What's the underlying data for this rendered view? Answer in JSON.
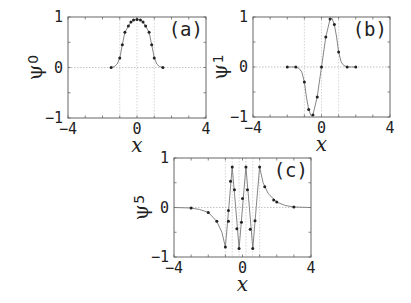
{
  "chart_data": [
    {
      "type": "line",
      "panel_tag": "(a)",
      "ylabel": "ψ",
      "ylabel_sub": "0",
      "xlabel": "x",
      "xlim": [
        -4,
        4
      ],
      "ylim": [
        -1,
        1
      ],
      "xticks": [
        -4,
        0,
        4
      ],
      "yticks": [
        -1,
        0,
        1
      ],
      "xtick_labels": [
        "−4",
        "0",
        "4"
      ],
      "ytick_labels": [
        "−1",
        "0",
        "1"
      ],
      "grid_x": [
        -1,
        0,
        1
      ],
      "markers": {
        "x": [
          -1.5,
          -1.0,
          -0.85,
          -0.7,
          -0.5,
          -0.35,
          -0.2,
          0.0,
          0.2,
          0.35,
          0.5,
          0.7,
          0.85,
          1.0,
          1.5
        ],
        "y": [
          0.0,
          0.19,
          0.45,
          0.7,
          0.82,
          0.9,
          0.94,
          0.95,
          0.94,
          0.9,
          0.82,
          0.7,
          0.45,
          0.19,
          0.0
        ]
      },
      "curve": {
        "x": [
          -1.5,
          -1.3,
          -1.15,
          -1.0,
          -0.85,
          -0.7,
          -0.5,
          -0.35,
          -0.2,
          0.0,
          0.2,
          0.35,
          0.5,
          0.7,
          0.85,
          1.0,
          1.15,
          1.3,
          1.5
        ],
        "y": [
          0.0,
          0.02,
          0.07,
          0.19,
          0.45,
          0.7,
          0.82,
          0.9,
          0.94,
          0.95,
          0.94,
          0.9,
          0.82,
          0.7,
          0.45,
          0.19,
          0.07,
          0.02,
          0.0
        ]
      }
    },
    {
      "type": "line",
      "panel_tag": "(b)",
      "ylabel": "ψ",
      "ylabel_sub": "1",
      "xlabel": "x",
      "xlim": [
        -4,
        4
      ],
      "ylim": [
        -1,
        1
      ],
      "xticks": [
        -4,
        0,
        4
      ],
      "yticks": [
        -1,
        0,
        1
      ],
      "xtick_labels": [
        "−4",
        "0",
        "4"
      ],
      "ytick_labels": [
        "−1",
        "0",
        "1"
      ],
      "grid_x": [
        -1,
        0,
        1
      ],
      "markers": {
        "x": [
          -2.0,
          -1.5,
          -1.0,
          -0.75,
          -0.5,
          -0.25,
          0.0,
          0.25,
          0.5,
          0.75,
          1.0,
          1.5,
          2.0
        ],
        "y": [
          0.0,
          0.0,
          -0.3,
          -0.85,
          -0.96,
          -0.6,
          0.0,
          0.6,
          0.96,
          0.85,
          0.3,
          0.0,
          0.0
        ]
      },
      "curve": {
        "x": [
          -2.0,
          -1.5,
          -1.3,
          -1.15,
          -1.0,
          -0.88,
          -0.75,
          -0.62,
          -0.5,
          -0.25,
          0.0,
          0.25,
          0.5,
          0.62,
          0.75,
          0.88,
          1.0,
          1.15,
          1.3,
          1.5,
          2.0
        ],
        "y": [
          0.0,
          0.0,
          -0.03,
          -0.1,
          -0.3,
          -0.6,
          -0.85,
          -0.97,
          -0.96,
          -0.6,
          0.0,
          0.6,
          0.96,
          0.97,
          0.85,
          0.6,
          0.3,
          0.1,
          0.03,
          0.0,
          0.0
        ]
      }
    },
    {
      "type": "line",
      "panel_tag": "(c)",
      "ylabel": "ψ",
      "ylabel_sub": "5",
      "xlabel": "x",
      "xlim": [
        -4,
        4
      ],
      "ylim": [
        -1,
        1
      ],
      "xticks": [
        -4,
        0,
        4
      ],
      "yticks": [
        -1,
        0,
        1
      ],
      "xtick_labels": [
        "−4",
        "0",
        "4"
      ],
      "ytick_labels": [
        "−1",
        "0",
        "1"
      ],
      "grid_x": [
        -1,
        -0.6,
        -0.2,
        0.2,
        0.6,
        1
      ],
      "markers": {
        "x": [
          -3.0,
          -2.0,
          -1.5,
          -1.0,
          -0.82,
          -0.82,
          -0.7,
          -0.6,
          -0.47,
          -0.33,
          -0.2,
          -0.06,
          0.0,
          0.2,
          0.29,
          0.45,
          0.6,
          0.73,
          1.0,
          1.3,
          1.82,
          2.0,
          3.0
        ],
        "y": [
          -0.01,
          -0.1,
          -0.28,
          -0.8,
          -0.28,
          -0.06,
          0.53,
          0.82,
          0.36,
          -0.43,
          -0.83,
          -0.3,
          0.18,
          0.82,
          0.36,
          -0.44,
          -0.83,
          -0.27,
          0.82,
          0.42,
          0.15,
          0.11,
          0.01
        ]
      },
      "curve": {
        "x": [
          -4.0,
          -3.0,
          -2.5,
          -2.0,
          -1.5,
          -1.2,
          -1.0,
          -0.8,
          -0.6,
          -0.4,
          -0.2,
          0.0,
          0.2,
          0.4,
          0.6,
          0.8,
          1.0,
          1.2,
          1.5,
          2.0,
          2.5,
          3.0,
          4.0
        ],
        "y": [
          0.0,
          -0.01,
          -0.04,
          -0.1,
          -0.28,
          -0.5,
          -0.8,
          0.0,
          0.82,
          0.0,
          -0.83,
          0.0,
          0.82,
          0.0,
          -0.83,
          0.0,
          0.82,
          0.5,
          0.28,
          0.11,
          0.04,
          0.01,
          0.0
        ]
      }
    }
  ],
  "panels": [
    {
      "id": "a",
      "frame": {
        "left": 68,
        "top": 17,
        "right": 206,
        "bottom": 118
      }
    },
    {
      "id": "b",
      "frame": {
        "left": 253,
        "top": 17,
        "right": 390,
        "bottom": 117
      }
    },
    {
      "id": "c",
      "frame": {
        "left": 174,
        "top": 158,
        "right": 311,
        "bottom": 257
      }
    }
  ]
}
